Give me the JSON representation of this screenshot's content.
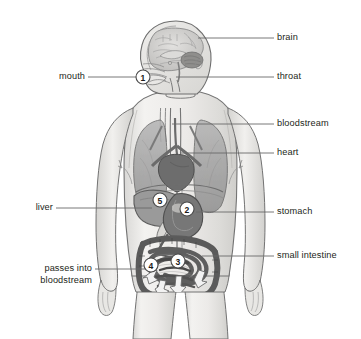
{
  "diagram": {
    "style": "grayscale anatomical illustration",
    "background_color": "#ffffff",
    "line_color": "#5a5a5a",
    "label_color": "#231f20"
  },
  "labels": {
    "brain": "brain",
    "throat": "throat",
    "bloodstream": "bloodstream",
    "heart": "heart",
    "stomach": "stomach",
    "small_intestine": "small intestine",
    "mouth": "mouth",
    "liver": "liver",
    "passes_into_line1": "passes into",
    "passes_into_line2": "bloodstream"
  },
  "markers": [
    {
      "number": "1",
      "organ": "mouth",
      "x": 143,
      "y": 77
    },
    {
      "number": "2",
      "organ": "stomach",
      "x": 187,
      "y": 209
    },
    {
      "number": "3",
      "organ": "small intestine",
      "x": 178,
      "y": 261
    },
    {
      "number": "4",
      "organ": "passes into bloodstream",
      "x": 151,
      "y": 265
    },
    {
      "number": "5",
      "organ": "liver",
      "x": 160,
      "y": 200
    }
  ],
  "organs": {
    "brain": "brain",
    "cerebellum": "cerebellum",
    "throat": "throat",
    "lung_left": "left lung",
    "lung_right": "right lung",
    "heart": "heart",
    "liver": "liver",
    "stomach": "stomach",
    "small_intestine": "small intestine",
    "large_intestine": "large intestine",
    "esophagus": "esophagus",
    "bloodstream": "bloodstream"
  },
  "colors": {
    "body_fill": "#efeeec",
    "body_outline": "#6e6e6e",
    "organ_mid": "#9b9b9b",
    "organ_dark": "#6f6f6f",
    "organ_darker": "#575757",
    "organ_light": "#c9c9c9",
    "arrow_fill": "#f4f4f4",
    "leader_line": "#6a6a6a"
  }
}
